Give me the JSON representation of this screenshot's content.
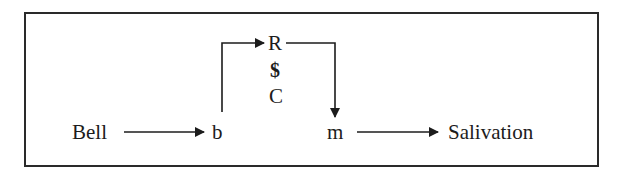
{
  "diagram": {
    "type": "flow",
    "nodes": {
      "bell": "Bell",
      "b": "b",
      "r": "R",
      "dollar": "$",
      "c": "C",
      "m": "m",
      "salivation": "Salivation"
    },
    "edges": [
      {
        "from": "Bell",
        "to": "b"
      },
      {
        "from": "b",
        "to": "R"
      },
      {
        "from": "R",
        "to": "m"
      },
      {
        "from": "m",
        "to": "Salivation"
      }
    ],
    "colors": {
      "ink": "#1c1c1c",
      "border": "#2a2a2a",
      "background": "#ffffff"
    }
  }
}
